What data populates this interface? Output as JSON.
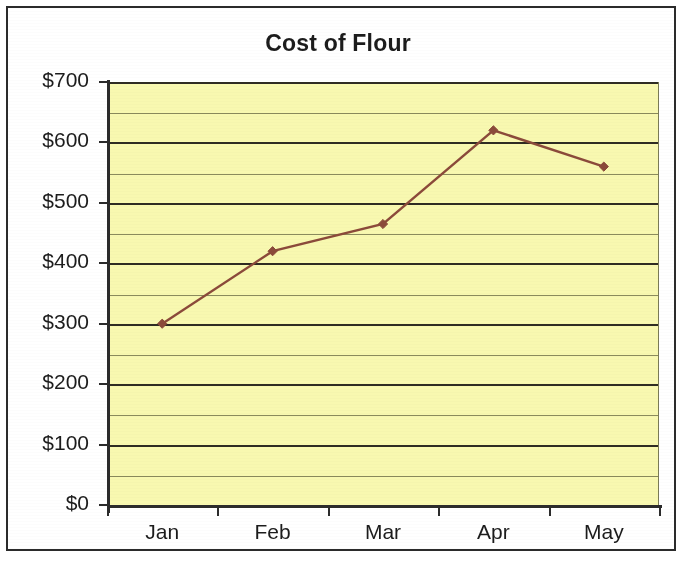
{
  "chart_data": {
    "type": "line",
    "title": "Cost of Flour",
    "xlabel": "",
    "ylabel": "",
    "categories": [
      "Jan",
      "Feb",
      "Mar",
      "Apr",
      "May"
    ],
    "values": [
      300,
      420,
      465,
      620,
      560
    ],
    "series": [
      {
        "name": "Cost of Flour",
        "values": [
          300,
          420,
          465,
          620,
          560
        ]
      }
    ],
    "ylim": [
      0,
      700
    ],
    "y_tick_labels": [
      "$0",
      "$100",
      "$200",
      "$300",
      "$400",
      "$500",
      "$600",
      "$700"
    ],
    "y_tick_values": [
      0,
      100,
      200,
      300,
      400,
      500,
      600,
      700
    ],
    "y_minor_step": 50,
    "grid": "horizontal-major-and-minor",
    "legend": "none",
    "marker": "diamond",
    "colors": {
      "plot_background": "#f8f8b0",
      "series_line": "#8b4a3a",
      "series_marker": "#8b4a3a",
      "major_gridline": "#2e2b22",
      "minor_gridline": "#8a8a5c",
      "axis": "#2b2b2b",
      "text": "#1c1c1c",
      "frame_border": "#2b2b2b",
      "page_background": "#ffffff"
    }
  }
}
